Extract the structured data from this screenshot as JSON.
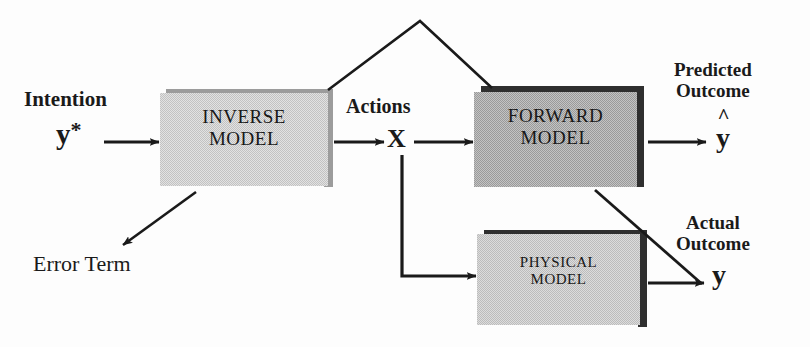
{
  "diagram": {
    "colors": {
      "ink": "#1a1a1a",
      "inverse_box_fill": "#d6d6d6",
      "forward_box_fill": "#b2b2b2",
      "physical_box_fill": "#cfcfcf",
      "shadow_dark": "#3a3a3a",
      "shadow_mid": "#8e8e8e",
      "background": "#fdfdfd"
    },
    "boxes": [
      {
        "id": "inverse-model",
        "line1": "INVERSE",
        "line2": "MODEL",
        "fill": "#d6d6d6",
        "x": 160,
        "y": 93,
        "w": 168,
        "h": 93,
        "font_size": 19
      },
      {
        "id": "forward-model",
        "line1": "FORWARD",
        "line2": "MODEL",
        "fill": "#b2b2b2",
        "x": 474,
        "y": 92,
        "w": 163,
        "h": 95,
        "font_size": 19
      },
      {
        "id": "physical-model",
        "line1": "PHYSICAL",
        "line2": "MODEL",
        "fill": "#cfcfcf",
        "x": 477,
        "y": 234,
        "w": 163,
        "h": 91,
        "font_size": 15
      }
    ],
    "labels": {
      "intention": "Intention",
      "intention_symbol": "y",
      "intention_superscript": "*",
      "actions": "Actions",
      "actions_symbol": "X",
      "predicted_outcome_line1": "Predicted",
      "predicted_outcome_line2": "Outcome",
      "predicted_symbol": "y",
      "predicted_hat": "^",
      "actual_outcome_line1": "Actual",
      "actual_outcome_line2": "Outcome",
      "actual_symbol": "y",
      "error_term": "Error Term"
    },
    "connectors": [
      {
        "id": "intention-to-inverse",
        "kind": "arrow"
      },
      {
        "id": "inverse-to-actions",
        "kind": "arrow"
      },
      {
        "id": "actions-to-forward",
        "kind": "arrow"
      },
      {
        "id": "forward-to-predicted",
        "kind": "arrow"
      },
      {
        "id": "actions-to-physical",
        "kind": "elbow-arrow"
      },
      {
        "id": "physical-to-actual",
        "kind": "arrow"
      },
      {
        "id": "inverse-to-error-term",
        "kind": "diagonal-arrow"
      },
      {
        "id": "inverse-top-to-forward-top",
        "kind": "peak-line"
      },
      {
        "id": "forward-bottom-to-actual",
        "kind": "diagonal-line"
      }
    ]
  }
}
